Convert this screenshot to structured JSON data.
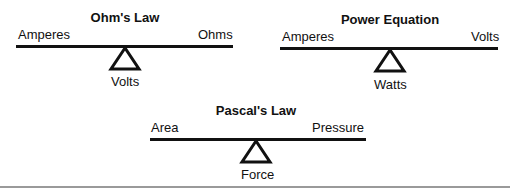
{
  "diagrams": [
    {
      "title": "Ohm's Law",
      "left_label": "Amperes",
      "right_label": "Ohms",
      "fulcrum_label": "Volts"
    },
    {
      "title": "Power Equation",
      "left_label": "Amperes",
      "right_label": "Volts",
      "fulcrum_label": "Watts"
    },
    {
      "title": "Pascal's Law",
      "left_label": "Area",
      "right_label": "Pressure",
      "fulcrum_label": "Force"
    }
  ],
  "colors": {
    "ink": "#111111",
    "rule": "#9a9a9a",
    "background": "#ffffff"
  }
}
